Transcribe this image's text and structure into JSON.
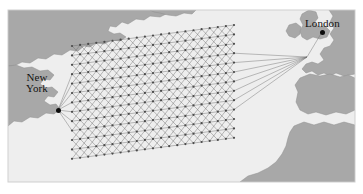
{
  "figure": {
    "width": 363,
    "height": 194,
    "background_color": "#ffffff"
  },
  "map": {
    "frame": {
      "x": 8,
      "y": 10,
      "width": 347,
      "height": 172
    },
    "ocean_color": "#eeeeee",
    "land_color": "#a8a8a8",
    "land_outline_color": "#8f8f8f",
    "frame_border_color": "#cfcfcf"
  },
  "cities": [
    {
      "id": "new-york",
      "label_lines": [
        "New",
        "York"
      ],
      "label_text": "New York",
      "dot": {
        "x": 58,
        "y": 110
      }
    },
    {
      "id": "london",
      "label_lines": [
        "London"
      ],
      "label_text": "London",
      "dot": {
        "x": 322,
        "y": 32
      }
    }
  ],
  "network": {
    "description": "Rotated rectangular trellis lattice of nodes spanning the North Atlantic; each node links to horizontal and diagonal neighbours.",
    "node_color": "#4a4a4a",
    "edge_color": "#6e6e6e",
    "fan_edge_color": "#707070",
    "node_radius": 1.1,
    "edge_width": 0.45,
    "columns": 21,
    "rows": 13,
    "col_spacing": 8.1,
    "row_spacing": 9.4,
    "origin": {
      "x": 72,
      "y": 46
    },
    "shear_per_column": -1.05,
    "endpoints": {
      "west": {
        "x": 58,
        "y": 110
      },
      "east": {
        "x": 307,
        "y": 57
      }
    },
    "west_fan_rows": 7,
    "east_fan_rows": 7
  },
  "landmasses": [
    {
      "name": "north-america-canada"
    },
    {
      "name": "north-america-usa-east-coast"
    },
    {
      "name": "greenland-edge"
    },
    {
      "name": "ireland"
    },
    {
      "name": "great-britain"
    },
    {
      "name": "continental-europe"
    },
    {
      "name": "iberia"
    },
    {
      "name": "north-africa"
    }
  ]
}
